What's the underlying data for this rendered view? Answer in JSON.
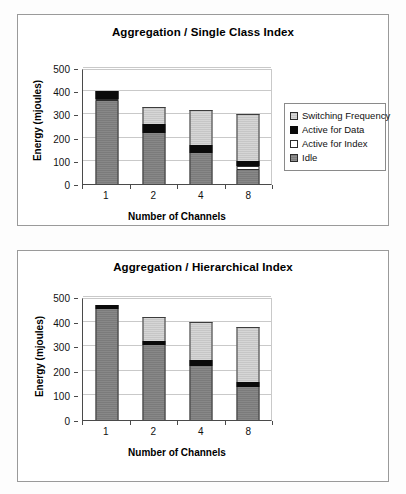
{
  "charts": [
    {
      "id": "chart-1",
      "chart_data": {
        "type": "bar",
        "stacked": true,
        "title": "Aggregation / Single Class Index",
        "xlabel": "Number of Channels",
        "ylabel": "Energy (mjoules)",
        "categories": [
          "1",
          "2",
          "4",
          "8"
        ],
        "ylim": [
          0,
          500
        ],
        "yticks": [
          0,
          100,
          200,
          300,
          400,
          500
        ],
        "grid": true,
        "legend_position": "right",
        "series": [
          {
            "name": "Idle",
            "color": "#7b7b7b",
            "values": [
              358,
              222,
              135,
              62
            ]
          },
          {
            "name": "Active for Index",
            "color": "#ffffff",
            "values": [
              10,
              0,
              0,
              14
            ]
          },
          {
            "name": "Active for Data",
            "color": "#0a0a0a",
            "values": [
              32,
              35,
              32,
              22
            ]
          },
          {
            "name": "Switching Frequency",
            "color": "#c6c6c6",
            "values": [
              0,
              73,
              153,
              202
            ]
          }
        ],
        "totals": [
          400,
          330,
          320,
          300
        ]
      },
      "legend": [
        {
          "label": "Switching Frequency",
          "swatch": "sw-switch"
        },
        {
          "label": "Active for Data",
          "swatch": "sw-data"
        },
        {
          "label": "Active for Index",
          "swatch": "sw-index"
        },
        {
          "label": "Idle",
          "swatch": "sw-idle"
        }
      ]
    },
    {
      "id": "chart-2",
      "chart_data": {
        "type": "bar",
        "stacked": true,
        "title": "Aggregation / Hierarchical Index",
        "xlabel": "Number of Channels",
        "ylabel": "Energy (mjoules)",
        "categories": [
          "1",
          "2",
          "4",
          "8"
        ],
        "ylim": [
          0,
          500
        ],
        "yticks": [
          0,
          100,
          200,
          300,
          400,
          500
        ],
        "grid": true,
        "legend_position": "right",
        "series": [
          {
            "name": "Idle",
            "color": "#7b7b7b",
            "values": [
              450,
              305,
              220,
              135
            ]
          },
          {
            "name": "Active for Index",
            "color": "#ffffff",
            "values": [
              0,
              0,
              0,
              0
            ]
          },
          {
            "name": "Active for Data",
            "color": "#0a0a0a",
            "values": [
              18,
              18,
              25,
              20
            ]
          },
          {
            "name": "Switching Frequency",
            "color": "#c6c6c6",
            "values": [
              0,
              97,
              155,
              223
            ]
          }
        ],
        "totals": [
          468,
          420,
          400,
          378
        ]
      },
      "legend": [
        {
          "label": "Switching Frequency",
          "swatch": "sw-switch"
        },
        {
          "label": "Active for Data",
          "swatch": "sw-data"
        },
        {
          "label": "Active for Index",
          "swatch": "sw-index"
        },
        {
          "label": "Idle",
          "swatch": "sw-idle"
        }
      ]
    }
  ]
}
